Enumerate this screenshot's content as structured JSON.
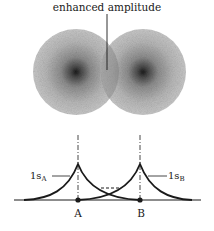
{
  "figure": {
    "top_label": "enhanced amplitude",
    "orbital_a_label": "1s",
    "orbital_a_sub": "A",
    "orbital_b_label": "1s",
    "orbital_b_sub": "B",
    "nucleus_a_label": "A",
    "nucleus_b_label": "B"
  },
  "colors": {
    "ink": "#1a1a1a",
    "cloud": "#b5b5b5",
    "cloud_core": "#2a2a2a",
    "background": "#ffffff"
  }
}
